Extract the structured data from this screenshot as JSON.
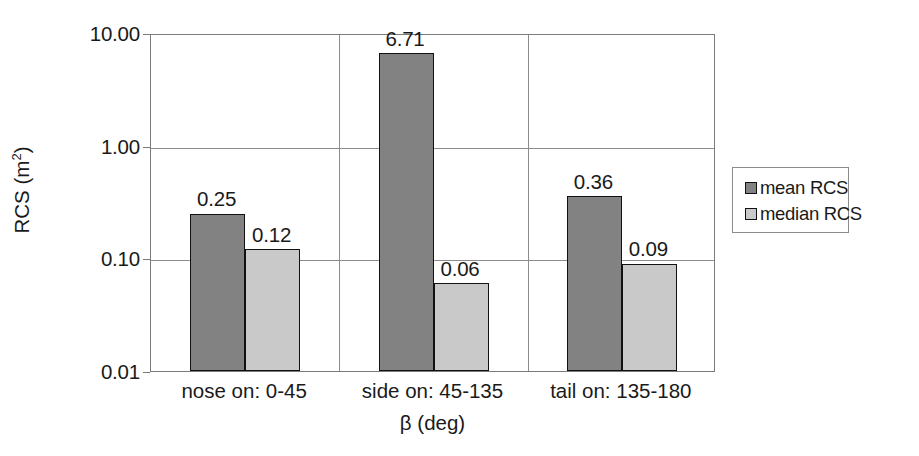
{
  "chart_data": {
    "type": "bar",
    "title": "",
    "xlabel": "β (deg)",
    "ylabel": "RCS (m²)",
    "ylabel_base": "RCS (m",
    "ylabel_sup": "2",
    "ylabel_close": ")",
    "yscale": "log",
    "ylim": [
      0.01,
      10.0
    ],
    "ytick_labels": [
      "10.00",
      "1.00",
      "0.10",
      "0.01"
    ],
    "ytick_values": [
      10.0,
      1.0,
      0.1,
      0.01
    ],
    "grid": true,
    "legend_position": "right",
    "categories": [
      "nose on: 0-45",
      "side on: 45-135",
      "tail on: 135-180"
    ],
    "series": [
      {
        "name": "mean RCS",
        "color": "#828282",
        "values": [
          0.25,
          6.71,
          0.36
        ],
        "labels": [
          "0.25",
          "6.71",
          "0.36"
        ]
      },
      {
        "name": "median RCS",
        "color": "#c9c9c9",
        "values": [
          0.12,
          0.06,
          0.09
        ],
        "labels": [
          "0.12",
          "0.06",
          "0.09"
        ]
      }
    ]
  },
  "legend": {
    "entries": [
      {
        "label": "mean RCS"
      },
      {
        "label": "median RCS"
      }
    ]
  }
}
